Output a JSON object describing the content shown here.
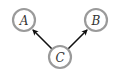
{
  "diagram": {
    "type": "directed-graph",
    "nodes": [
      {
        "id": "A",
        "label": "A",
        "cx": 24,
        "cy": 20,
        "r": 11
      },
      {
        "id": "B",
        "label": "B",
        "cx": 96,
        "cy": 20,
        "r": 11
      },
      {
        "id": "C",
        "label": "C",
        "cx": 60,
        "cy": 57,
        "r": 11
      }
    ],
    "edges": [
      {
        "from": "C",
        "to": "A"
      },
      {
        "from": "C",
        "to": "B"
      }
    ],
    "colors": {
      "node_stroke": "#9a9a9a",
      "edge": "#111111",
      "label": "#333333",
      "background": "#ffffff"
    }
  }
}
